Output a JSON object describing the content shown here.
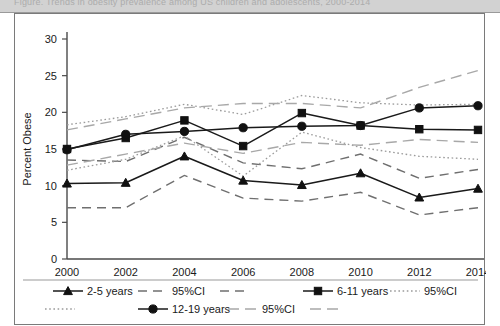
{
  "caption": {
    "text": "Figure. Trends in obesity prevalence among US children and adolescents, 2000-2014"
  },
  "chart_data": {
    "type": "line",
    "title": "",
    "xlabel": "",
    "ylabel": "Percent Obese",
    "x": [
      2000,
      2002,
      2004,
      2006,
      2008,
      2010,
      2012,
      2014
    ],
    "xticklabels": [
      "2000",
      "2002",
      "2004",
      "2006",
      "2008",
      "2010",
      "2012",
      "2014"
    ],
    "yticklabels": [
      "0",
      "5",
      "10",
      "15",
      "20",
      "25",
      "30"
    ],
    "ylim": [
      0,
      30
    ],
    "xlim": [
      2000,
      2014
    ],
    "ytick_step": 5,
    "grid": false,
    "legend_position": "bottom",
    "series": [
      {
        "name": "2-5 years",
        "marker": "triangle",
        "style": "solid",
        "values": [
          10.3,
          10.4,
          14.0,
          10.7,
          10.1,
          11.7,
          8.4,
          9.6
        ]
      },
      {
        "name": "2-5 years 95%CI upper",
        "style": "dash",
        "ci_for": "2-5 years",
        "values": [
          13.5,
          13.3,
          16.6,
          13.1,
          12.3,
          14.3,
          11.0,
          12.2
        ]
      },
      {
        "name": "2-5 years 95%CI lower",
        "style": "dash",
        "ci_for": "2-5 years",
        "values": [
          7.0,
          7.0,
          11.4,
          8.3,
          7.9,
          9.1,
          6.0,
          7.0
        ]
      },
      {
        "name": "6-11 years",
        "marker": "square",
        "style": "solid",
        "values": [
          15.0,
          16.5,
          18.9,
          15.4,
          19.9,
          18.2,
          17.7,
          17.6
        ]
      },
      {
        "name": "6-11 years 95%CI upper",
        "style": "dot",
        "ci_for": "6-11 years",
        "values": [
          18.3,
          19.4,
          21.1,
          19.7,
          22.3,
          21.3,
          21.0,
          21.1
        ]
      },
      {
        "name": "6-11 years 95%CI lower",
        "style": "dot",
        "ci_for": "6-11 years",
        "values": [
          12.1,
          13.6,
          16.8,
          11.3,
          17.3,
          15.2,
          14.0,
          13.6
        ]
      },
      {
        "name": "12-19 years",
        "marker": "circle",
        "style": "solid",
        "values": [
          14.9,
          17.0,
          17.4,
          17.9,
          18.1,
          18.2,
          20.6,
          20.9
        ]
      },
      {
        "name": "12-19 years 95%CI upper",
        "style": "longdash",
        "ci_for": "12-19 years",
        "values": [
          17.6,
          19.1,
          20.6,
          21.2,
          21.2,
          20.6,
          23.4,
          25.7
        ]
      },
      {
        "name": "12-19 years 95%CI lower",
        "style": "longdash",
        "ci_for": "12-19 years",
        "values": [
          12.8,
          14.3,
          15.8,
          14.4,
          15.9,
          15.5,
          16.3,
          15.9
        ]
      }
    ]
  },
  "legend": {
    "row1": [
      {
        "label": "2-5 years",
        "marker": "triangle",
        "style": "solid"
      },
      {
        "label": "95%CI",
        "marker": "none",
        "style": "dash"
      },
      {
        "label": "",
        "marker": "none",
        "style": "dash"
      },
      {
        "label": "6-11 years",
        "marker": "square",
        "style": "solid"
      },
      {
        "label": "95%CI",
        "marker": "none",
        "style": "dot"
      }
    ],
    "row2": [
      {
        "label": "",
        "marker": "none",
        "style": "dot"
      },
      {
        "label": "12-19 years",
        "marker": "circle",
        "style": "solid"
      },
      {
        "label": "95%CI",
        "marker": "none",
        "style": "longdash"
      },
      {
        "label": "",
        "marker": "none",
        "style": "longdash"
      }
    ]
  }
}
